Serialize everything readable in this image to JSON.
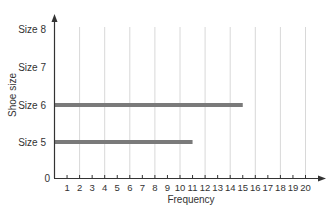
{
  "chart_data": {
    "type": "bar",
    "orientation": "horizontal",
    "title": "",
    "xlabel": "Frequency",
    "ylabel": "Shoe size",
    "categories": [
      "Size 5",
      "Size 6",
      "Size 7",
      "Size 8"
    ],
    "values": [
      11,
      15,
      0,
      0
    ],
    "xlim": [
      0,
      20
    ],
    "xticks": [
      1,
      2,
      3,
      4,
      5,
      6,
      7,
      8,
      9,
      10,
      11,
      12,
      13,
      14,
      15,
      16,
      17,
      18,
      19,
      20
    ],
    "y_origin_label": "0",
    "grid": {
      "vertical": true,
      "at": [
        2,
        4,
        6,
        8,
        10,
        12,
        14,
        16,
        18,
        20
      ]
    },
    "legend": null,
    "colors": {
      "bar": "#7a7a7a",
      "axis": "#333333",
      "grid": "#d8d8d8"
    }
  }
}
